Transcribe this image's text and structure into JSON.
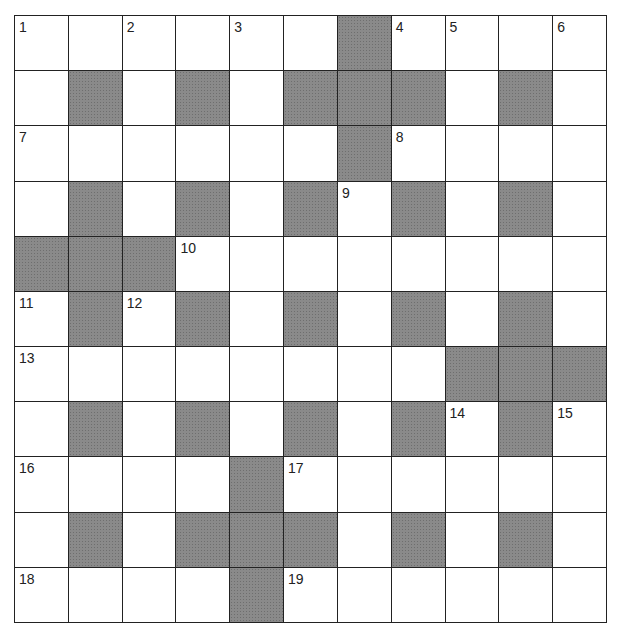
{
  "puzzle": {
    "type": "crossword",
    "rows": 11,
    "cols": 11,
    "block_color": "#8a8a8a",
    "line_color": "#222222",
    "grid": [
      "WWWWWWBWWWW",
      "WBWBWBBBWBW",
      "WWWWWWBWWWW",
      "WBWBWBWBWBW",
      "BBBWWWWWWWW",
      "WBWBWBWBWBW",
      "WWWWWWWWBBB",
      "WBWBWBWBWBW",
      "WWWWBWWWWWW",
      "WBWBBBWBWBW",
      "WWWWBWWWWWW"
    ],
    "numbers": [
      {
        "row": 0,
        "col": 0,
        "n": "1"
      },
      {
        "row": 0,
        "col": 2,
        "n": "2"
      },
      {
        "row": 0,
        "col": 4,
        "n": "3"
      },
      {
        "row": 0,
        "col": 7,
        "n": "4"
      },
      {
        "row": 0,
        "col": 8,
        "n": "5"
      },
      {
        "row": 0,
        "col": 10,
        "n": "6"
      },
      {
        "row": 2,
        "col": 0,
        "n": "7"
      },
      {
        "row": 2,
        "col": 7,
        "n": "8"
      },
      {
        "row": 3,
        "col": 6,
        "n": "9"
      },
      {
        "row": 4,
        "col": 3,
        "n": "10"
      },
      {
        "row": 5,
        "col": 0,
        "n": "11"
      },
      {
        "row": 5,
        "col": 2,
        "n": "12"
      },
      {
        "row": 6,
        "col": 0,
        "n": "13"
      },
      {
        "row": 7,
        "col": 8,
        "n": "14"
      },
      {
        "row": 7,
        "col": 10,
        "n": "15"
      },
      {
        "row": 8,
        "col": 0,
        "n": "16"
      },
      {
        "row": 8,
        "col": 5,
        "n": "17"
      },
      {
        "row": 10,
        "col": 0,
        "n": "18"
      },
      {
        "row": 10,
        "col": 5,
        "n": "19"
      }
    ]
  }
}
